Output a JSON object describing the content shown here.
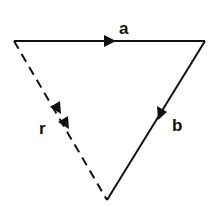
{
  "diagram": {
    "type": "vector-triangle",
    "vectors": [
      {
        "label": "a",
        "style": "solid",
        "from": "top-left",
        "to": "top-right"
      },
      {
        "label": "b",
        "style": "solid",
        "from": "top-right",
        "to": "bottom"
      },
      {
        "label": "r",
        "style": "dashed",
        "from": "top-left",
        "to": "bottom",
        "arrowheads": 2
      }
    ],
    "colors": {
      "stroke": "#111111",
      "background": "#ffffff"
    }
  }
}
